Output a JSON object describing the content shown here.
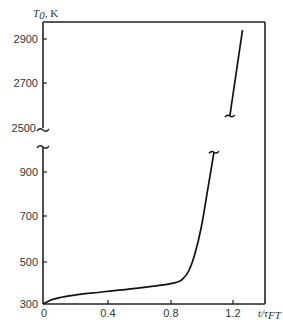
{
  "chart_data": {
    "type": "line",
    "title": "",
    "xlabel": "t/τ_FT",
    "ylabel": "T_0, K",
    "xlim": [
      0,
      1.42
    ],
    "ylim_lower": [
      300,
      1000
    ],
    "ylim_upper": [
      2500,
      2980
    ],
    "y_axis_break": true,
    "grid": false,
    "legend": null,
    "x_ticks": [
      "0",
      "0.4",
      "0.8",
      "1.2"
    ],
    "y_ticks": [
      "300",
      "500",
      "700",
      "900",
      "2500",
      "2700",
      "2900"
    ],
    "series": [
      {
        "name": "T0 lower segment",
        "x": [
          0,
          0.05,
          0.1,
          0.2,
          0.3,
          0.4,
          0.5,
          0.6,
          0.7,
          0.8,
          0.85,
          0.88,
          0.92,
          0.96,
          1.0,
          1.04,
          1.08
        ],
        "y": [
          300,
          318,
          328,
          340,
          349,
          357,
          364,
          372,
          381,
          392,
          400,
          412,
          450,
          530,
          650,
          820,
          990
        ]
      },
      {
        "name": "T0 upper segment",
        "x": [
          1.18,
          1.26
        ],
        "y": [
          2550,
          2940
        ]
      }
    ]
  },
  "labels": {
    "y_title_main": "T",
    "y_title_sub": "0",
    "y_title_unit": ", K",
    "x_title_main": "t/τ",
    "x_title_sub": "FT"
  }
}
